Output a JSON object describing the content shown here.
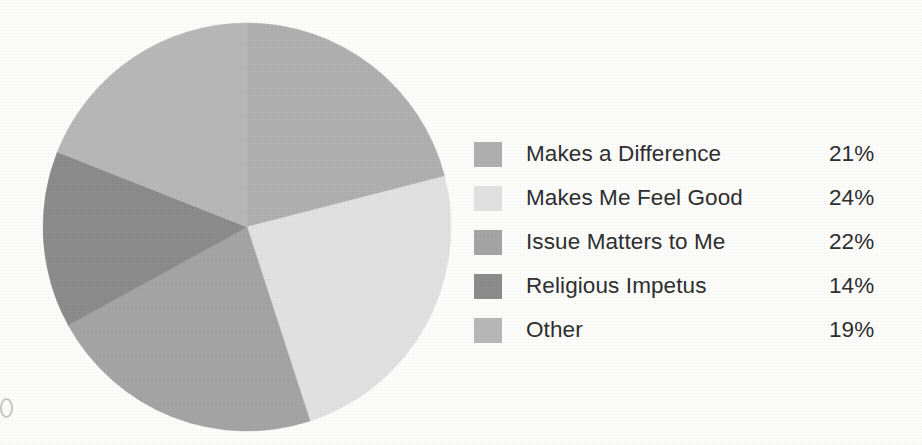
{
  "chart_data": {
    "type": "pie",
    "title": "",
    "subtitle": "",
    "xlabel": "",
    "ylabel": "",
    "legend_position": "right",
    "grid": false,
    "start_angle_deg": 0,
    "direction": "clockwise",
    "categories": [
      "Makes a Difference",
      "Makes Me Feel Good",
      "Issue Matters to Me",
      "Religious Impetus",
      "Other"
    ],
    "values": [
      21,
      24,
      22,
      14,
      19
    ],
    "value_labels": [
      "21%",
      "24%",
      "22%",
      "14%",
      "19%"
    ],
    "unit": "%",
    "total": 100,
    "colors": [
      "#b0b0b0",
      "#e2e2e2",
      "#a5a5a5",
      "#8c8c8c",
      "#b8b8b8"
    ],
    "slices": [
      {
        "label": "Makes a Difference",
        "value": 21,
        "display": "21%",
        "color": "#b0b0b0"
      },
      {
        "label": "Makes Me Feel Good",
        "value": 24,
        "display": "24%",
        "color": "#e2e2e2"
      },
      {
        "label": "Issue Matters to Me",
        "value": 22,
        "display": "22%",
        "color": "#a5a5a5"
      },
      {
        "label": "Religious Impetus",
        "value": 14,
        "display": "14%",
        "color": "#8c8c8c"
      },
      {
        "label": "Other",
        "value": 19,
        "display": "19%",
        "color": "#b8b8b8"
      }
    ]
  },
  "legend": {
    "items": [
      {
        "label": "Makes a Difference",
        "value": "21%",
        "color": "#b0b0b0"
      },
      {
        "label": "Makes Me Feel Good",
        "value": "24%",
        "color": "#e2e2e2"
      },
      {
        "label": "Issue Matters to Me",
        "value": "22%",
        "color": "#a5a5a5"
      },
      {
        "label": "Religious Impetus",
        "value": "14%",
        "color": "#8c8c8c"
      },
      {
        "label": "Other",
        "value": "19%",
        "color": "#b8b8b8"
      }
    ]
  },
  "style": {
    "background": "#fdfdfc",
    "text_color": "#2f2f2f",
    "pie_center_x": 205,
    "pie_center_y": 205,
    "pie_radius": 204
  }
}
